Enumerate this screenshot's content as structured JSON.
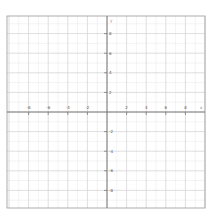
{
  "chart_data": {
    "type": "line",
    "title": "",
    "xlabel": "x",
    "ylabel": "y",
    "xlim": [
      -10,
      10
    ],
    "ylim": [
      -10,
      10
    ],
    "grid": true,
    "grid_minor_step": 1,
    "grid_major_step": 2,
    "x_ticks": [
      -8,
      -6,
      -4,
      -2,
      2,
      4,
      6,
      8
    ],
    "y_ticks": [
      8,
      6,
      4,
      2,
      -2,
      -4,
      -6,
      -8
    ],
    "x_tick_labels": [
      "-8",
      "-6",
      "-4",
      "-2",
      "2",
      "4",
      "6",
      "8"
    ],
    "y_tick_labels": [
      "8",
      "6",
      "4",
      "2",
      "-2",
      "-4",
      "-6",
      "-8"
    ],
    "series": []
  },
  "layout": {
    "frame": {
      "left": 7,
      "top": 16,
      "right": 205,
      "bottom": 208
    },
    "origin": {
      "x": 107,
      "y": 112
    },
    "unit_px": 9.8
  },
  "colors": {
    "background": "#ffffff",
    "frame": "#9a9a9a",
    "grid_minor": "#ebebeb",
    "grid_major": "#d6d6d6",
    "axis": "#6e6e6e",
    "tick_label": "#555555"
  }
}
